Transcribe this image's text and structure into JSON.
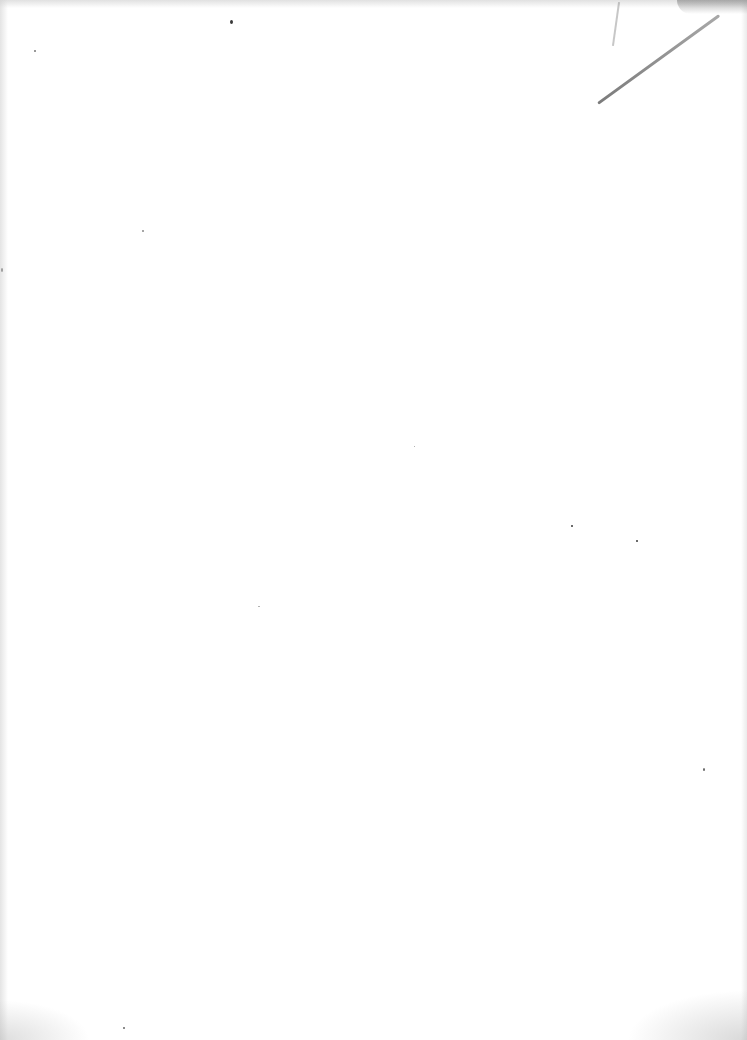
{
  "page": {
    "type": "blank scanned page",
    "text": "",
    "background_color": "#ffffff",
    "mark_color": "#5a5a5a"
  },
  "marks": [
    {
      "name": "pencil-stroke",
      "description": "diagonal pencil line, top-right corner"
    },
    {
      "name": "speck",
      "x": 231,
      "y": 22
    },
    {
      "name": "speck",
      "x": 35,
      "y": 51
    },
    {
      "name": "speck",
      "x": 572,
      "y": 526
    },
    {
      "name": "speck",
      "x": 637,
      "y": 541
    },
    {
      "name": "speck",
      "x": 704,
      "y": 770
    },
    {
      "name": "speck",
      "x": 143,
      "y": 231
    },
    {
      "name": "speck",
      "x": 124,
      "y": 1028
    }
  ]
}
